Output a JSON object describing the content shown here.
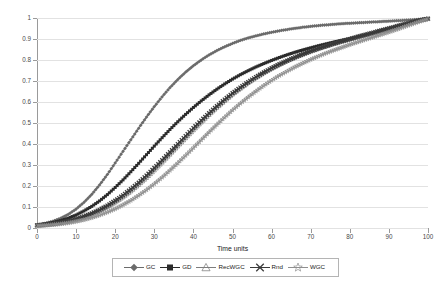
{
  "chart_data": {
    "type": "line",
    "title": "",
    "xlabel": "Time units",
    "ylabel": "Fraction of discovered hidden profiles",
    "xlim": [
      0,
      100
    ],
    "ylim": [
      0,
      1
    ],
    "xticks": [
      0,
      10,
      20,
      30,
      40,
      50,
      60,
      70,
      80,
      90,
      100
    ],
    "yticks": [
      "0",
      "0.1",
      "0.2",
      "0.3",
      "0.4",
      "0.5",
      "0.6",
      "0.7",
      "0.8",
      "0.9",
      "1"
    ],
    "grid": true,
    "legend_position": "bottom",
    "x": [
      0,
      2,
      4,
      6,
      8,
      10,
      12,
      14,
      16,
      18,
      20,
      22,
      24,
      26,
      28,
      30,
      32,
      34,
      36,
      38,
      40,
      42,
      44,
      46,
      48,
      50,
      52,
      54,
      56,
      58,
      60,
      62,
      64,
      66,
      68,
      70,
      72,
      74,
      76,
      78,
      80,
      82,
      84,
      86,
      88,
      90,
      92,
      94,
      96,
      98,
      100
    ],
    "series": [
      {
        "name": "GC",
        "marker": "diamond",
        "color": "#6b6b6b",
        "values": [
          0.015,
          0.022,
          0.032,
          0.046,
          0.065,
          0.09,
          0.122,
          0.16,
          0.205,
          0.255,
          0.31,
          0.365,
          0.42,
          0.475,
          0.528,
          0.578,
          0.625,
          0.668,
          0.707,
          0.742,
          0.773,
          0.8,
          0.824,
          0.845,
          0.863,
          0.879,
          0.893,
          0.905,
          0.915,
          0.924,
          0.932,
          0.939,
          0.945,
          0.951,
          0.956,
          0.96,
          0.964,
          0.967,
          0.97,
          0.973,
          0.975,
          0.977,
          0.979,
          0.981,
          0.983,
          0.985,
          0.987,
          0.989,
          0.991,
          0.994,
          0.998
        ]
      },
      {
        "name": "GD",
        "marker": "square",
        "color": "#2b2b2b",
        "values": [
          0.014,
          0.019,
          0.026,
          0.035,
          0.047,
          0.062,
          0.081,
          0.103,
          0.129,
          0.159,
          0.193,
          0.229,
          0.268,
          0.308,
          0.349,
          0.39,
          0.43,
          0.469,
          0.506,
          0.541,
          0.574,
          0.605,
          0.634,
          0.661,
          0.686,
          0.709,
          0.73,
          0.749,
          0.767,
          0.783,
          0.798,
          0.812,
          0.825,
          0.837,
          0.848,
          0.858,
          0.868,
          0.877,
          0.886,
          0.894,
          0.902,
          0.91,
          0.918,
          0.926,
          0.935,
          0.944,
          0.954,
          0.965,
          0.977,
          0.988,
          0.997
        ]
      },
      {
        "name": "RecWGC",
        "marker": "triangle",
        "color": "#7d7d7d",
        "values": [
          0.012,
          0.015,
          0.019,
          0.024,
          0.031,
          0.04,
          0.051,
          0.065,
          0.081,
          0.1,
          0.122,
          0.147,
          0.175,
          0.206,
          0.239,
          0.275,
          0.312,
          0.35,
          0.389,
          0.428,
          0.466,
          0.503,
          0.539,
          0.573,
          0.605,
          0.636,
          0.664,
          0.691,
          0.715,
          0.738,
          0.759,
          0.778,
          0.796,
          0.812,
          0.827,
          0.841,
          0.854,
          0.866,
          0.877,
          0.888,
          0.898,
          0.908,
          0.918,
          0.928,
          0.938,
          0.948,
          0.958,
          0.969,
          0.979,
          0.989,
          0.996
        ]
      },
      {
        "name": "Rnd",
        "marker": "xmark",
        "color": "#3a3a3a",
        "values": [
          0.013,
          0.016,
          0.02,
          0.026,
          0.033,
          0.043,
          0.055,
          0.07,
          0.087,
          0.107,
          0.13,
          0.156,
          0.185,
          0.216,
          0.25,
          0.286,
          0.323,
          0.361,
          0.4,
          0.438,
          0.476,
          0.512,
          0.547,
          0.58,
          0.612,
          0.642,
          0.669,
          0.695,
          0.719,
          0.741,
          0.761,
          0.78,
          0.797,
          0.813,
          0.828,
          0.842,
          0.855,
          0.867,
          0.879,
          0.89,
          0.9,
          0.911,
          0.921,
          0.931,
          0.941,
          0.951,
          0.961,
          0.971,
          0.981,
          0.99,
          0.997
        ]
      },
      {
        "name": "WGC",
        "marker": "star",
        "color": "#8f8f8f",
        "values": [
          0.01,
          0.012,
          0.015,
          0.019,
          0.024,
          0.031,
          0.039,
          0.049,
          0.061,
          0.075,
          0.091,
          0.11,
          0.131,
          0.155,
          0.181,
          0.21,
          0.241,
          0.274,
          0.309,
          0.345,
          0.382,
          0.419,
          0.456,
          0.492,
          0.527,
          0.561,
          0.593,
          0.623,
          0.651,
          0.678,
          0.703,
          0.726,
          0.747,
          0.767,
          0.785,
          0.802,
          0.818,
          0.833,
          0.847,
          0.86,
          0.873,
          0.885,
          0.897,
          0.909,
          0.921,
          0.933,
          0.945,
          0.958,
          0.971,
          0.984,
          0.995
        ]
      }
    ]
  }
}
